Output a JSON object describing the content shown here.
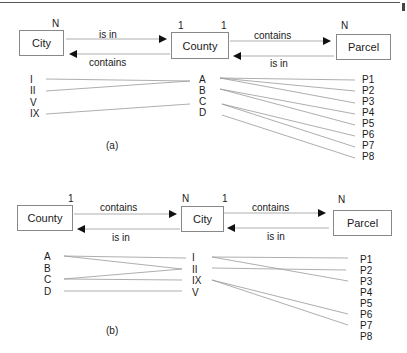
{
  "diagram_a": {
    "caption": "(a)",
    "entities": [
      {
        "name": "City",
        "cardinality": "N"
      },
      {
        "name": "County",
        "cardinality_left": "1",
        "cardinality_right": "1"
      },
      {
        "name": "Parcel",
        "cardinality": "N"
      }
    ],
    "relations": {
      "left_top": "is in",
      "left_bottom": "contains",
      "right_top": "contains",
      "right_bottom": "is in"
    },
    "left_items": [
      "I",
      "II",
      "V",
      "IX"
    ],
    "mid_items": [
      "A",
      "B",
      "C",
      "D"
    ],
    "right_items": [
      "P1",
      "P2",
      "P3",
      "P4",
      "P5",
      "P6",
      "P7",
      "P8"
    ],
    "left_links": [
      [
        "I",
        "A"
      ],
      [
        "II",
        "A"
      ],
      [
        "IX",
        "C"
      ]
    ],
    "right_links": [
      [
        "A",
        "P1"
      ],
      [
        "A",
        "P2"
      ],
      [
        "A",
        "P3"
      ],
      [
        "B",
        "P4"
      ],
      [
        "B",
        "P5"
      ],
      [
        "C",
        "P6"
      ],
      [
        "C",
        "P7"
      ],
      [
        "D",
        "P8"
      ]
    ]
  },
  "diagram_b": {
    "caption": "(b)",
    "entities": [
      {
        "name": "County",
        "cardinality": "1"
      },
      {
        "name": "City",
        "cardinality_left": "N",
        "cardinality_right": "1"
      },
      {
        "name": "Parcel",
        "cardinality": "N"
      }
    ],
    "relations": {
      "left_top": "contains",
      "left_bottom": "is in",
      "right_top": "contains",
      "right_bottom": "is in"
    },
    "left_items": [
      "A",
      "B",
      "C",
      "D"
    ],
    "mid_items": [
      "I",
      "II",
      "IX",
      "V"
    ],
    "right_items": [
      "P1",
      "P2",
      "P3",
      "P4",
      "P5",
      "P6",
      "P7",
      "P8"
    ],
    "left_links": [
      [
        "A",
        "I"
      ],
      [
        "B",
        "II"
      ],
      [
        "C",
        "II"
      ],
      [
        "D",
        "V"
      ]
    ],
    "right_links": [
      [
        "I",
        "P1"
      ],
      [
        "I",
        "P3"
      ],
      [
        "II",
        "P2"
      ],
      [
        "IX",
        "P6"
      ],
      [
        "IX",
        "P7"
      ]
    ]
  }
}
